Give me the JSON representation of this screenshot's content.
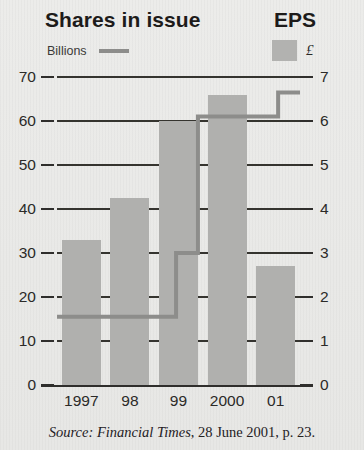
{
  "header": {
    "title": "Shares in issue",
    "right_title": "EPS"
  },
  "legend": {
    "left_label": "Billions",
    "left_swatch": "line-swatch",
    "right_label": "£",
    "right_swatch": "bar-swatch"
  },
  "caption": {
    "source_word": "Source:",
    "publication": "Financial Times",
    "rest": ", 28 June 2001, p. 23."
  },
  "colors": {
    "bar": "#b0b0ae",
    "line": "#8d8d8b",
    "axis": "#2f2e2c",
    "background": "#e9e9e7",
    "text": "#231f20"
  },
  "chart_data": {
    "type": "bar",
    "title": "Shares in issue",
    "subtitle": "EPS",
    "xlabel": "",
    "ylabel": "Billions",
    "y2label": "£",
    "categories": [
      "1997",
      "98",
      "99",
      "2000",
      "01"
    ],
    "ylim": [
      0,
      70
    ],
    "yticks": [
      0,
      10,
      20,
      30,
      40,
      50,
      60,
      70
    ],
    "y2lim": [
      0,
      7
    ],
    "y2ticks": [
      0,
      1,
      2,
      3,
      4,
      5,
      6,
      7
    ],
    "grid": true,
    "legend_position": "top",
    "series": [
      {
        "name": "Billions",
        "type": "bar",
        "axis": "left",
        "values": [
          33,
          42.5,
          60,
          66,
          27
        ]
      },
      {
        "name": "£",
        "type": "step-line",
        "axis": "right",
        "values": [
          1.55,
          1.55,
          1.55,
          6.1,
          6.65
        ],
        "step_points": [
          {
            "x": 0.0,
            "y": 1.55
          },
          {
            "x": 2.45,
            "y": 1.55
          },
          {
            "x": 2.45,
            "y": 3.0
          },
          {
            "x": 2.9,
            "y": 3.0
          },
          {
            "x": 2.9,
            "y": 6.1
          },
          {
            "x": 4.55,
            "y": 6.1
          },
          {
            "x": 4.55,
            "y": 6.65
          },
          {
            "x": 5.0,
            "y": 6.65
          }
        ]
      }
    ]
  }
}
